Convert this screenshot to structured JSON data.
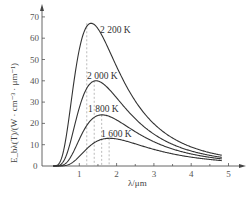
{
  "chart_data": {
    "type": "line",
    "title": "",
    "xlabel": "λ/μm",
    "ylabel": "E_bλ(T)/(W · cm⁻³ · μm⁻¹)",
    "xlim": [
      0,
      5
    ],
    "ylim": [
      0,
      70
    ],
    "x_ticks": [
      1,
      2,
      3,
      4,
      5
    ],
    "y_ticks": [
      0,
      10,
      20,
      30,
      40,
      50,
      60,
      70
    ],
    "grid": false,
    "legend": "inline labels on curves",
    "series": [
      {
        "name": "2 200 K",
        "temperature_K": 2200,
        "peak_lambda_um": 1.2,
        "peak_value": 67,
        "x": [
          0.3,
          0.6,
          0.8,
          1.0,
          1.2,
          1.5,
          2.0,
          2.5,
          3.0,
          3.5,
          4.0,
          4.8
        ],
        "values": [
          0,
          8,
          34,
          58,
          67,
          58,
          35,
          20,
          12,
          8,
          6,
          4
        ]
      },
      {
        "name": "2 000 K",
        "temperature_K": 2000,
        "peak_lambda_um": 1.4,
        "peak_value": 40,
        "x": [
          0.3,
          0.6,
          0.8,
          1.0,
          1.4,
          1.8,
          2.0,
          2.5,
          3.0,
          3.5,
          4.0,
          4.8
        ],
        "values": [
          0,
          3,
          13,
          26,
          40,
          36,
          31,
          19,
          12,
          8,
          6,
          4
        ]
      },
      {
        "name": "1 800 K",
        "temperature_K": 1800,
        "peak_lambda_um": 1.6,
        "peak_value": 24,
        "x": [
          0.3,
          0.6,
          0.8,
          1.0,
          1.6,
          2.0,
          2.5,
          3.0,
          3.5,
          4.0,
          4.8
        ],
        "values": [
          0,
          1,
          5,
          11,
          24,
          21,
          15,
          11,
          8,
          6,
          4
        ]
      },
      {
        "name": "1 600 K",
        "temperature_K": 1600,
        "peak_lambda_um": 1.8,
        "peak_value": 13,
        "x": [
          0.3,
          0.6,
          0.8,
          1.0,
          1.8,
          2.0,
          2.5,
          3.0,
          3.5,
          4.0,
          4.8
        ],
        "values": [
          0,
          0.3,
          1.5,
          4,
          13,
          13,
          11,
          9,
          7,
          5,
          4
        ]
      }
    ],
    "annotations": [
      "dashed vertical lines at each curve's peak wavelength"
    ]
  },
  "labels": {
    "curve_2200": "2 200 K",
    "curve_2000": "2 000 K",
    "curve_1800": "1 800 K",
    "curve_1600": "1 600 K",
    "xlabel": "λ/μm",
    "ylabel": "E_bλ(T)/(W · cm⁻³ · μm⁻¹)",
    "origin": "0"
  },
  "colors": {
    "curve": "#333333",
    "axis": "#555555",
    "dashed": "#aaaaaa"
  }
}
